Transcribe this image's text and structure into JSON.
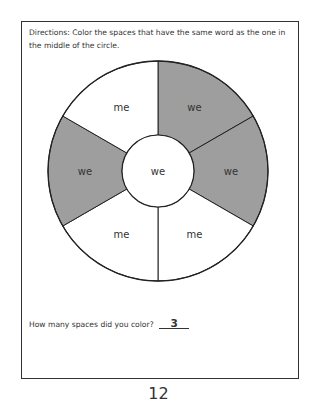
{
  "worksheet": {
    "directions": "Directions: Color the spaces that have the same word as the one in the middle of the circle.",
    "center_word": "we",
    "sectors": [
      {
        "position": "top-right",
        "word": "we",
        "colored": true
      },
      {
        "position": "right",
        "word": "we",
        "colored": true
      },
      {
        "position": "bottom-right",
        "word": "me",
        "colored": false
      },
      {
        "position": "bottom-left",
        "word": "me",
        "colored": false
      },
      {
        "position": "left",
        "word": "we",
        "colored": true
      },
      {
        "position": "top-left",
        "word": "me",
        "colored": false
      }
    ],
    "question": "How many spaces did you color?",
    "answer": "3",
    "colors": {
      "shaded": "#9e9e9e",
      "line": "#222222",
      "background": "#ffffff"
    }
  },
  "page_number": "12"
}
